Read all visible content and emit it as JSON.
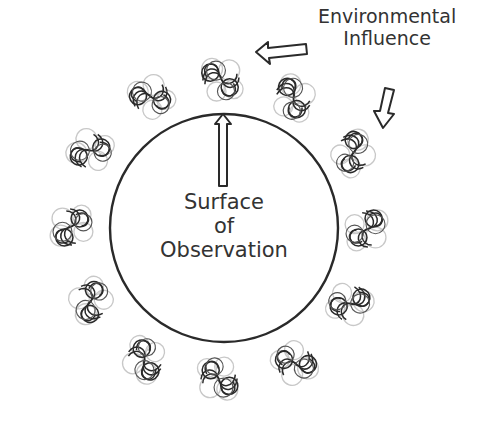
{
  "diagram": {
    "labels": {
      "environmental": [
        "Environmental",
        "Influence"
      ],
      "surface": [
        "Surface",
        "of",
        "Observation"
      ]
    },
    "circle": {
      "cx": 224,
      "cy": 228,
      "r": 114,
      "stroke": "#2a2a2a"
    },
    "swirl_clusters": [
      {
        "name": "top",
        "x": 220,
        "y": 80
      },
      {
        "name": "upper-right",
        "x": 292,
        "y": 98
      },
      {
        "name": "right-upper",
        "x": 352,
        "y": 152
      },
      {
        "name": "right",
        "x": 366,
        "y": 228
      },
      {
        "name": "right-lower",
        "x": 350,
        "y": 302
      },
      {
        "name": "lower-right",
        "x": 296,
        "y": 362
      },
      {
        "name": "bottom",
        "x": 220,
        "y": 378
      },
      {
        "name": "lower-left",
        "x": 146,
        "y": 360
      },
      {
        "name": "left-lower",
        "x": 92,
        "y": 302
      },
      {
        "name": "left",
        "x": 72,
        "y": 228
      },
      {
        "name": "left-upper",
        "x": 90,
        "y": 152
      },
      {
        "name": "upper-left",
        "x": 150,
        "y": 98
      }
    ],
    "arrows": [
      {
        "name": "environment-arrow-left",
        "direction": "left"
      },
      {
        "name": "environment-arrow-down",
        "direction": "down"
      },
      {
        "name": "surface-arrow-up",
        "direction": "up"
      }
    ],
    "colors": {
      "line": "#2a2a2a",
      "text": "#333333",
      "faint": "#bbbbbb"
    }
  }
}
